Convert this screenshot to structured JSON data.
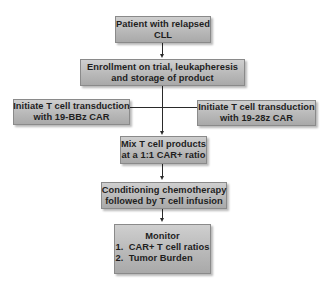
{
  "flowchart": {
    "nodes": {
      "patient": {
        "line1": "Patient with relapsed",
        "line2": "CLL"
      },
      "enrollment": {
        "line1": "Enrollment on trial, leukapheresis",
        "line2": "and storage of product"
      },
      "transduction_bbz": {
        "line1": "Initiate T cell transduction",
        "line2": "with 19-BBz CAR"
      },
      "transduction_28z": {
        "line1": "Initiate T cell transduction",
        "line2": "with 19-28z CAR"
      },
      "mix": {
        "line1": "Mix T cell products",
        "line2": "at a 1:1 CAR+ ratio"
      },
      "conditioning": {
        "line1": "Conditioning chemotherapy",
        "line2": "followed by T cell infusion"
      },
      "monitor": {
        "title": "Monitor",
        "items": [
          "1.  CAR+ T cell ratios",
          "2.  Tumor Burden"
        ]
      }
    },
    "edges": [
      {
        "from": "patient",
        "to": "enrollment"
      },
      {
        "from": "enrollment",
        "to": "mix"
      },
      {
        "from": "transduction_bbz",
        "to": "mix"
      },
      {
        "from": "transduction_28z",
        "to": "mix"
      },
      {
        "from": "mix",
        "to": "conditioning"
      },
      {
        "from": "conditioning",
        "to": "monitor"
      }
    ],
    "colors": {
      "box_fill_top": "#cfcfcf",
      "box_fill_bottom": "#a9a9a9",
      "box_border": "#8a8a8a",
      "connector": "#2a2a2a",
      "text": "#1e1e1e",
      "background": "#ffffff"
    }
  }
}
